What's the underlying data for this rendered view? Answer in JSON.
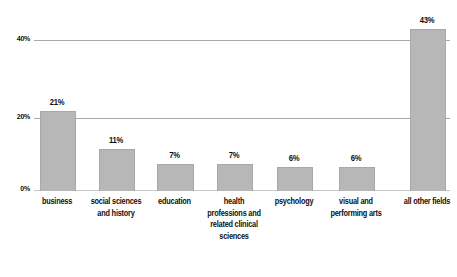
{
  "chart_data": {
    "type": "bar",
    "title": "",
    "subtitle": "",
    "xlabel": "",
    "ylabel": "",
    "ylim": [
      0,
      40
    ],
    "grid": true,
    "legend": "none",
    "y_ticks": [
      "0%",
      "20%",
      "40%"
    ],
    "y_tick_values": [
      0,
      20,
      40
    ],
    "categories": [
      "business",
      "social sciences and history",
      "education",
      "health professions and related clinical sciences",
      "psychology",
      "visual and performing arts",
      "all other fields"
    ],
    "values": [
      21,
      11,
      7,
      7,
      6,
      6,
      43
    ],
    "data_labels": [
      "21%",
      "11%",
      "7%",
      "7%",
      "6%",
      "6%",
      "43%"
    ],
    "bar_color": "#b7b7b7",
    "gridline_color": "#9a9a9a",
    "text_color": "#101010"
  },
  "bars": [
    {
      "label": "business",
      "value_label": "21%",
      "left": 40,
      "width": 34
    },
    {
      "label": "social sciences and history",
      "value_label": "11%",
      "left": 99,
      "width": 34
    },
    {
      "label": "education",
      "value_label": "7%",
      "left": 157,
      "width": 35
    },
    {
      "label": "health professions and related clinical sciences",
      "value_label": "7%",
      "left": 217,
      "width": 34
    },
    {
      "label": "psychology",
      "value_label": "6%",
      "left": 277,
      "width": 34
    },
    {
      "label": "visual and performing arts",
      "value_label": "6%",
      "left": 339,
      "width": 34
    },
    {
      "label": "all other fields",
      "value_label": "43%",
      "left": 410,
      "width": 34
    }
  ],
  "axis": {
    "tick_40": "40%",
    "tick_20": "20%",
    "tick_0": "0%"
  }
}
